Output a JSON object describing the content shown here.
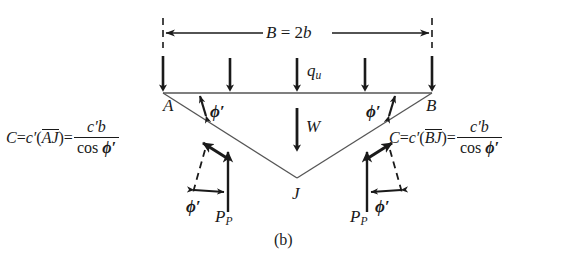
{
  "figure": {
    "caption": "(b)",
    "type": "free-body diagram of soil wedge beneath a strip footing"
  },
  "dimension": {
    "label_B": "B",
    "label_eq": " = 2",
    "label_b": "b",
    "full_text": "B = 2b"
  },
  "loads": {
    "surcharge_symbol": "q",
    "surcharge_subscript": "u",
    "weight_symbol": "W",
    "passive_symbol": "P",
    "passive_subscript": "P",
    "arrow_count": 5
  },
  "vertices": {
    "left": "A",
    "right": "B",
    "apex": "J"
  },
  "angles": {
    "friction_symbol": "ϕ",
    "friction_prime": "′",
    "friction_label": "ϕ′",
    "count": 4
  },
  "equations": {
    "left": {
      "lhs": "C",
      "eq1": " = ",
      "coh": "c",
      "coh_prime": "′",
      "open_paren": "(",
      "segment": "AJ",
      "close_paren": ")",
      "eq2": " = ",
      "numerator_c": "c",
      "numerator_prime": "′",
      "numerator_b": "b",
      "denominator_cos": "cos ",
      "denominator_phi": "ϕ′",
      "plain": "C = c′(AJ) = c′b / cos ϕ′"
    },
    "right": {
      "lhs": "C",
      "eq1": " = ",
      "coh": "c",
      "coh_prime": "′",
      "open_paren": "(",
      "segment": "BJ",
      "close_paren": ")",
      "eq2": " = ",
      "numerator_c": "c",
      "numerator_prime": "′",
      "numerator_b": "b",
      "denominator_cos": "cos ",
      "denominator_phi": "ϕ′",
      "plain": "C = c′(BJ) = c′b / cos ϕ′"
    }
  },
  "colors": {
    "ink": "#1a1a1a",
    "thin_line": "#555555",
    "background": "#ffffff"
  }
}
